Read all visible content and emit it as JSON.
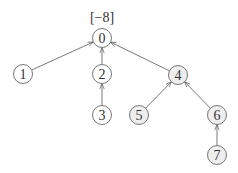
{
  "diagram": {
    "type": "tree",
    "root_annotation": "[−8]",
    "colors": {
      "edge": "#555555",
      "node_stroke": "#555555",
      "node_fill_plain": "#ffffff",
      "node_fill_shaded": "#eeeeee"
    },
    "nodes": [
      {
        "id": "0",
        "label": "0",
        "x": 102,
        "y": 38,
        "shaded": false
      },
      {
        "id": "1",
        "label": "1",
        "x": 23,
        "y": 74,
        "shaded": false
      },
      {
        "id": "2",
        "label": "2",
        "x": 102,
        "y": 74,
        "shaded": false
      },
      {
        "id": "3",
        "label": "3",
        "x": 102,
        "y": 115,
        "shaded": false
      },
      {
        "id": "4",
        "label": "4",
        "x": 178,
        "y": 75,
        "shaded": true
      },
      {
        "id": "5",
        "label": "5",
        "x": 139,
        "y": 115,
        "shaded": true
      },
      {
        "id": "6",
        "label": "6",
        "x": 217,
        "y": 115,
        "shaded": true
      },
      {
        "id": "7",
        "label": "7",
        "x": 217,
        "y": 155,
        "shaded": true
      }
    ],
    "edges": [
      {
        "from": "1",
        "to": "0"
      },
      {
        "from": "2",
        "to": "0"
      },
      {
        "from": "4",
        "to": "0"
      },
      {
        "from": "3",
        "to": "2"
      },
      {
        "from": "5",
        "to": "4"
      },
      {
        "from": "6",
        "to": "4"
      },
      {
        "from": "7",
        "to": "6"
      }
    ]
  }
}
